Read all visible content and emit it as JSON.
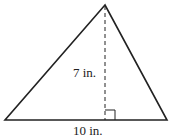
{
  "figure": {
    "type": "triangle",
    "height_label": "7 in.",
    "base_label": "10 in.",
    "vertices": {
      "apex": [
        105,
        5
      ],
      "bottom_left": [
        5,
        120
      ],
      "bottom_right": [
        167,
        120
      ]
    },
    "altitude": {
      "x": 105,
      "y1": 5,
      "y2": 120,
      "style": "dashed"
    },
    "right_angle_marker": {
      "x": 105,
      "y": 110,
      "size": 10
    },
    "stroke_color": "#222222"
  }
}
